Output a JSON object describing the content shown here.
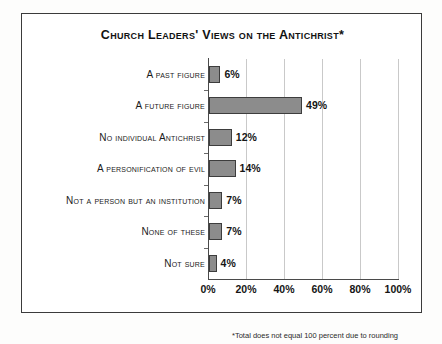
{
  "chart_data": {
    "type": "bar",
    "orientation": "horizontal",
    "title": "Church Leaders' Views on the Antichrist*",
    "xlabel": "",
    "ylabel": "",
    "xlim": [
      0,
      100
    ],
    "grid": true,
    "legend": false,
    "categories": [
      "A past figure",
      "A future figure",
      "No individual Antichrist",
      "A personification of evil",
      "Not a person but an institution",
      "None of these",
      "Not sure"
    ],
    "values": [
      6,
      49,
      12,
      14,
      7,
      7,
      4
    ],
    "value_labels": [
      "6%",
      "49%",
      "12%",
      "14%",
      "7%",
      "7%",
      "4%"
    ],
    "xticks": [
      0,
      20,
      40,
      60,
      80,
      100
    ],
    "xtick_labels": [
      "0%",
      "20%",
      "40%",
      "60%",
      "80%",
      "100%"
    ],
    "annotation": "*Total does not equal 100 percent due to rounding",
    "colors": {
      "bar_fill": "#8c8c8c",
      "bar_border": "#3d3d3d",
      "gridline": "#c9c9c9",
      "axis": "#4a4a4a",
      "frame": "#3b3b3b",
      "text": "#151515",
      "background": "#ffffff"
    }
  }
}
